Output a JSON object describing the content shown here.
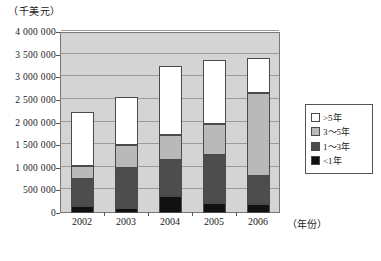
{
  "chart_data": {
    "type": "bar",
    "subtype": "stacked-vertical",
    "title": "",
    "unit_label": "（千美元）",
    "xlabel": "（年份）",
    "ylabel": "",
    "categories": [
      "2002",
      "2003",
      "2004",
      "2005",
      "2006"
    ],
    "ylim": [
      0,
      4000000
    ],
    "ytick_values": [
      0,
      500000,
      1000000,
      1500000,
      2000000,
      2500000,
      3000000,
      3500000,
      4000000
    ],
    "ytick_labels": [
      "0",
      "500 000",
      "1 000 000",
      "1 500 000",
      "2 000 000",
      "2 500 000",
      "3 000 000",
      "3 500 000",
      "4 000 000"
    ],
    "grid": true,
    "legend_position": "right",
    "series": [
      {
        "name": "<1年",
        "color": "#111111",
        "values": [
          160000,
          120000,
          370000,
          230000,
          200000
        ]
      },
      {
        "name": "1～3年",
        "color": "#4d4d4d",
        "values": [
          600000,
          880000,
          810000,
          1060000,
          620000
        ]
      },
      {
        "name": "3～5年",
        "color": "#b9b9b9",
        "values": [
          270000,
          500000,
          550000,
          680000,
          1830000
        ]
      },
      {
        "name": ">5年",
        "color": "#ffffff",
        "values": [
          1200000,
          1060000,
          1510000,
          1420000,
          780000
        ]
      }
    ],
    "totals": [
      2230000,
      2560000,
      3240000,
      3390000,
      3430000
    ]
  },
  "legend": {
    "items": [
      {
        "label": ">5年",
        "color": "#ffffff"
      },
      {
        "label": "3～5年",
        "color": "#b9b9b9"
      },
      {
        "label": "1～3年",
        "color": "#4d4d4d"
      },
      {
        "label": "<1年",
        "color": "#111111"
      }
    ]
  }
}
